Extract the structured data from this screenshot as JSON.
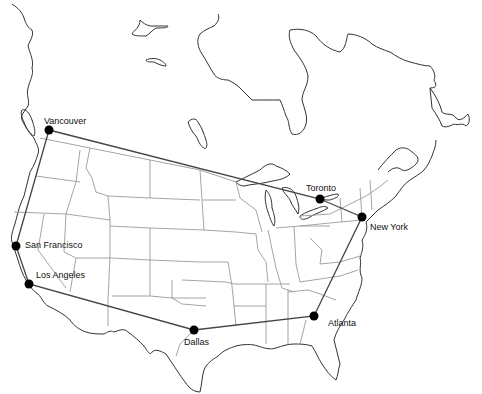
{
  "map": {
    "type": "route-map",
    "region": "North America (USA and Canada)",
    "route_order": [
      "Vancouver",
      "Toronto",
      "New York",
      "Atlanta",
      "Dallas",
      "Los Angeles",
      "San Francisco",
      "Vancouver"
    ],
    "cities": [
      {
        "name": "Vancouver",
        "x": 49,
        "y": 130,
        "label_x": 44,
        "label_y": 124
      },
      {
        "name": "Toronto",
        "x": 320,
        "y": 199,
        "label_x": 306,
        "label_y": 191
      },
      {
        "name": "New York",
        "x": 362,
        "y": 217,
        "label_x": 370,
        "label_y": 230
      },
      {
        "name": "San Francisco",
        "x": 16,
        "y": 246,
        "label_x": 25,
        "label_y": 248
      },
      {
        "name": "Los Angeles",
        "x": 29,
        "y": 284,
        "label_x": 36,
        "label_y": 278
      },
      {
        "name": "Dallas",
        "x": 194,
        "y": 330,
        "label_x": 184,
        "label_y": 345
      },
      {
        "name": "Atlanta",
        "x": 314,
        "y": 316,
        "label_x": 328,
        "label_y": 326
      }
    ],
    "colors": {
      "coastline": "#333333",
      "state_borders": "#9a9a9a",
      "route": "#444444",
      "city_marker": "#000000",
      "background": "#ffffff"
    }
  }
}
